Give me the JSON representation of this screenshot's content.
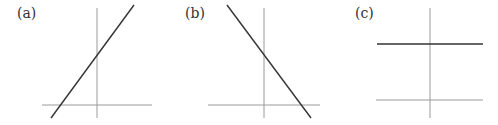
{
  "panels": [
    {
      "label": "(a)",
      "description": "line with positive slope, positive y-intercept",
      "axes": {
        "x": [
          42,
          105,
          152,
          105
        ],
        "y": [
          97,
          8,
          97,
          118
        ]
      },
      "line": [
        51,
        118,
        134,
        5
      ]
    },
    {
      "label": "(b)",
      "description": "line with negative slope, positive y-intercept",
      "axes": {
        "x": [
          208,
          105,
          320,
          105
        ],
        "y": [
          264,
          8,
          264,
          118
        ]
      },
      "line": [
        227,
        5,
        311,
        118
      ]
    },
    {
      "label": "(c)",
      "description": "horizontal line, zero slope, positive y-intercept",
      "axes": {
        "x": [
          376,
          100,
          483,
          100
        ],
        "y": [
          430,
          8,
          430,
          118
        ]
      },
      "line": [
        377,
        44,
        483,
        44
      ]
    }
  ],
  "colors": {
    "axis": "#9a9a9a",
    "line": "#333333"
  }
}
